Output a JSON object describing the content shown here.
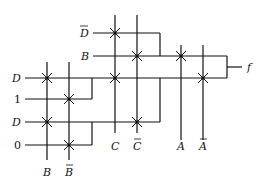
{
  "diagram": {
    "inputs_left": [
      {
        "label": "D",
        "bar": true,
        "y": 33,
        "x0": 93,
        "x1": 160
      },
      {
        "label": "B",
        "bar": false,
        "y": 56,
        "x0": 93,
        "x1": 227
      },
      {
        "label": "D",
        "bar": false,
        "y": 78,
        "x0": 25,
        "x1": 227
      },
      {
        "label": "1",
        "bar": false,
        "y": 99,
        "x0": 25,
        "x1": 92
      },
      {
        "label": "D",
        "bar": false,
        "y": 122,
        "x0": 25,
        "x1": 92
      },
      {
        "label": "0",
        "bar": false,
        "y": 145,
        "x0": 25,
        "x1": 92
      }
    ],
    "select_lines": [
      {
        "label": "B",
        "bar": false,
        "x": 47
      },
      {
        "label": "B",
        "bar": true,
        "x": 69
      },
      {
        "label": "C",
        "bar": false,
        "x": 115
      },
      {
        "label": "C",
        "bar": true,
        "x": 137
      },
      {
        "label": "A",
        "bar": false,
        "x": 181
      },
      {
        "label": "A",
        "bar": true,
        "x": 203
      }
    ],
    "output": {
      "label": "f"
    }
  }
}
